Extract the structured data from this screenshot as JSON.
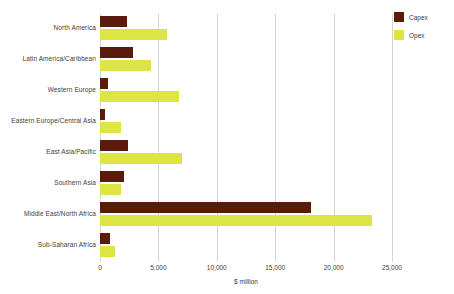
{
  "chart_data": {
    "type": "bar",
    "orientation": "horizontal",
    "title": "",
    "xlabel": "$ million",
    "ylabel": "",
    "xlim": [
      0,
      25000
    ],
    "xticks": [
      "0",
      "5,000",
      "10,000",
      "15,000",
      "20,000",
      "25,000"
    ],
    "xtick_values": [
      0,
      5000,
      10000,
      15000,
      20000,
      25000
    ],
    "grid": "vertical",
    "legend_position": "top-right",
    "categories": [
      "North America",
      "Latin America/Caribbean",
      "Western Europe",
      "Eastern Europe/Central Asia",
      "East Asia/Pacific",
      "Southern Asia",
      "Middle East/North Africa",
      "Sub-Saharan Africa"
    ],
    "series": [
      {
        "name": "Capex",
        "color": "#5a1a0c",
        "values": [
          2300,
          2800,
          700,
          450,
          2400,
          2050,
          18100,
          850
        ]
      },
      {
        "name": "Opex",
        "color": "#dde544",
        "values": [
          5700,
          4400,
          6800,
          1800,
          7000,
          1800,
          23300,
          1300
        ]
      }
    ]
  },
  "legend": {
    "items": [
      {
        "label": "Capex",
        "color": "#5a1a0c"
      },
      {
        "label": "Opex",
        "color": "#dde544"
      }
    ]
  },
  "axis": {
    "x_title": "$ million"
  }
}
